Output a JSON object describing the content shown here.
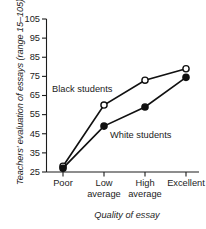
{
  "chart_data": {
    "type": "line",
    "title": "",
    "xlabel": "Quality of essay",
    "ylabel": "Teachers' evaluation of essays (range 15–105)",
    "categories": [
      "Poor",
      "Low average",
      "High average",
      "Excellent"
    ],
    "category_lines": [
      [
        "Poor"
      ],
      [
        "Low",
        "average"
      ],
      [
        "High",
        "average"
      ],
      [
        "Excellent"
      ]
    ],
    "yticks": [
      25,
      35,
      45,
      55,
      65,
      75,
      85,
      95,
      105
    ],
    "ytick_labels": [
      "25",
      "35",
      "45",
      "55",
      "65",
      "75",
      "85",
      "95",
      "105"
    ],
    "ylim": [
      25,
      105
    ],
    "grid": false,
    "legend_position": "inline-annotation",
    "series": [
      {
        "name": "Black students",
        "marker": "open-circle",
        "values": [
          28,
          60,
          73,
          79
        ]
      },
      {
        "name": "White students",
        "marker": "filled-circle",
        "values": [
          27,
          49,
          59,
          74.5
        ]
      }
    ],
    "annotations": [
      {
        "text": "Black students",
        "x_px": 52,
        "y_px": 84
      },
      {
        "text": "White students",
        "x_px": 110,
        "y_px": 130
      }
    ],
    "colors": {
      "axis": "#1c1c1c",
      "line": "#111111",
      "marker_fill_open": "#ffffff",
      "marker_fill_closed": "#111111"
    }
  }
}
